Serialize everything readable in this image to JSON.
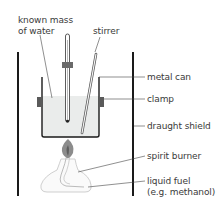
{
  "diagram": {
    "labels": {
      "known_mass_line1": "known mass",
      "known_mass_line2": "of water",
      "stirrer": "stirrer",
      "metal_can": "metal can",
      "clamp": "clamp",
      "draught_shield": "draught shield",
      "spirit_burner": "spirit burner",
      "liquid_fuel_line1": "liquid fuel",
      "liquid_fuel_line2": "(e.g. methanol)"
    },
    "colors": {
      "line": "#1a1a1a",
      "water": "#e8ebea",
      "clamp": "#555555",
      "flame": "#8a8a8a",
      "burner": "#c8c8c8"
    }
  }
}
